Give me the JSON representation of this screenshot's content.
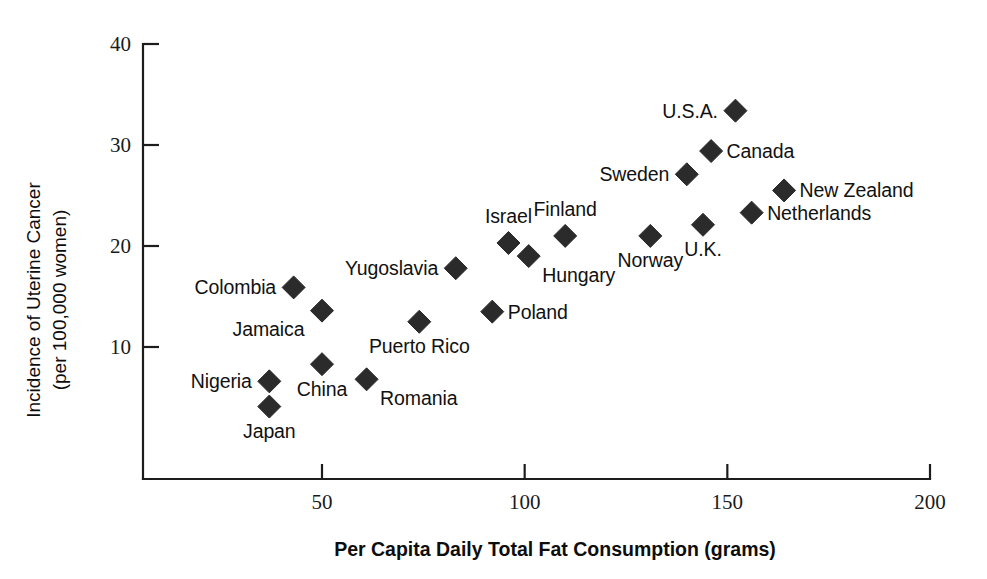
{
  "chart_data": {
    "type": "scatter",
    "title": "",
    "xlabel": "Per Capita Daily Total Fat Consumption (grams)",
    "ylabel_line1": "Incidence of Uterine Cancer",
    "ylabel_line2": "(per 100,000 women)",
    "xlim": [
      17,
      200
    ],
    "ylim": [
      0,
      40
    ],
    "xticks": [
      50,
      100,
      150,
      200
    ],
    "xtick_labels": [
      "50",
      "100",
      "150",
      "200"
    ],
    "yticks": [
      10,
      20,
      30,
      40
    ],
    "ytick_labels": [
      "10",
      "20",
      "30",
      "40"
    ],
    "grid": false,
    "legend": "none",
    "marker": "diamond",
    "marker_color": "#2b2b2b",
    "axis_color": "#1c1c1c",
    "points": [
      {
        "label": "Japan",
        "x": 37,
        "y": 4.1,
        "label_pos": "below"
      },
      {
        "label": "Nigeria",
        "x": 37,
        "y": 6.6,
        "label_pos": "left"
      },
      {
        "label": "China",
        "x": 50,
        "y": 8.3,
        "label_pos": "below"
      },
      {
        "label": "Romania",
        "x": 61,
        "y": 6.8,
        "label_pos": "right-below"
      },
      {
        "label": "Puerto Rico",
        "x": 74,
        "y": 12.5,
        "label_pos": "below"
      },
      {
        "label": "Colombia",
        "x": 43,
        "y": 15.9,
        "label_pos": "left"
      },
      {
        "label": "Jamaica",
        "x": 50,
        "y": 13.6,
        "label_pos": "left-below"
      },
      {
        "label": "Yugoslavia",
        "x": 83,
        "y": 17.8,
        "label_pos": "left"
      },
      {
        "label": "Poland",
        "x": 92,
        "y": 13.5,
        "label_pos": "right"
      },
      {
        "label": "Israel",
        "x": 96,
        "y": 20.3,
        "label_pos": "above"
      },
      {
        "label": "Hungary",
        "x": 101,
        "y": 19.0,
        "label_pos": "right-below"
      },
      {
        "label": "Finland",
        "x": 110,
        "y": 21.0,
        "label_pos": "above"
      },
      {
        "label": "Norway",
        "x": 131,
        "y": 21.0,
        "label_pos": "below"
      },
      {
        "label": "U.K.",
        "x": 144,
        "y": 22.1,
        "label_pos": "below"
      },
      {
        "label": "Sweden",
        "x": 140,
        "y": 27.1,
        "label_pos": "left"
      },
      {
        "label": "Canada",
        "x": 146,
        "y": 29.4,
        "label_pos": "right"
      },
      {
        "label": "U.S.A.",
        "x": 152,
        "y": 33.4,
        "label_pos": "left"
      },
      {
        "label": "Netherlands",
        "x": 156,
        "y": 23.3,
        "label_pos": "right"
      },
      {
        "label": "New Zealand",
        "x": 164,
        "y": 25.5,
        "label_pos": "right"
      }
    ]
  }
}
